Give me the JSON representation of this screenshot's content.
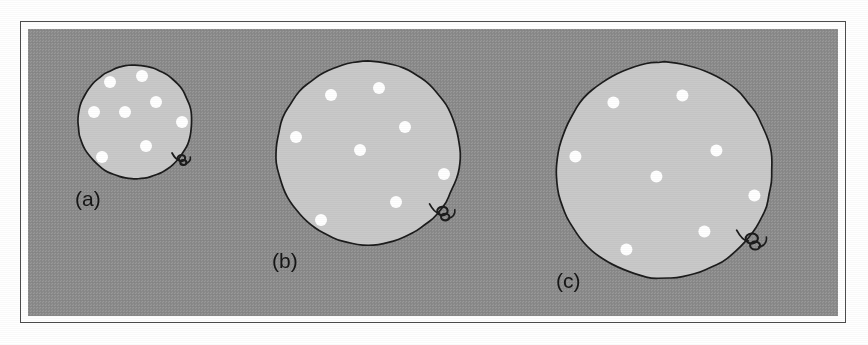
{
  "figure": {
    "caption_labels": [
      "(a)",
      "(b)",
      "(c)"
    ],
    "background_color": "#8d8d8d",
    "balloon_fill_color": "#c9c9c9",
    "balloon_outline_color": "#1c1c1c",
    "dot_color": "#ffffff",
    "label_color": "#161616",
    "frame_border_color": "#4d4d4d",
    "page_color": "#ffffff"
  },
  "chart_data": {
    "type": "scatter",
    "title": "",
    "xlabel": "",
    "ylabel": "",
    "panels": [
      {
        "label": "(a)",
        "radius": 57,
        "center": [
          135,
          122
        ],
        "dot_count": 8,
        "dot_radius": 6,
        "dots": [
          [
            110,
            82
          ],
          [
            142,
            76
          ],
          [
            156,
            102
          ],
          [
            94,
            112
          ],
          [
            125,
            112
          ],
          [
            182,
            122
          ],
          [
            146,
            146
          ],
          [
            102,
            157
          ]
        ],
        "label_position": [
          75,
          188
        ]
      },
      {
        "label": "(b)",
        "radius": 92,
        "center": [
          368,
          153
        ],
        "dot_count": 8,
        "dot_radius": 6,
        "dots": [
          [
            331,
            95
          ],
          [
            379,
            88
          ],
          [
            405,
            127
          ],
          [
            296,
            137
          ],
          [
            360,
            150
          ],
          [
            444,
            174
          ],
          [
            396,
            202
          ],
          [
            321,
            220
          ]
        ],
        "label_position": [
          272,
          250
        ]
      },
      {
        "label": "(c)",
        "radius": 108,
        "center": [
          664,
          170
        ],
        "dot_count": 8,
        "dot_radius": 6,
        "dots": [
          [
            613,
            102
          ],
          [
            682,
            95
          ],
          [
            716,
            150
          ],
          [
            575,
            156
          ],
          [
            656,
            176
          ],
          [
            754,
            195
          ],
          [
            704,
            231
          ],
          [
            626,
            249
          ]
        ],
        "label_position": [
          556,
          270
        ]
      }
    ]
  }
}
